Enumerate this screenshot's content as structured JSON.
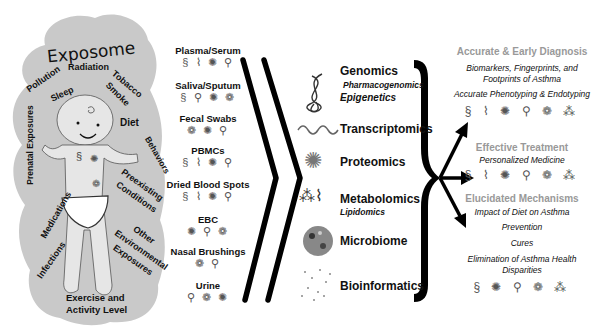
{
  "exposome": {
    "title": "Exposome",
    "factors": [
      "Radiation",
      "Pollution",
      "Sleep",
      "Tobacco",
      "Smoke",
      "Diet",
      "Prenatal Exposures",
      "Behaviors",
      "Preexisting",
      "Conditions",
      "Medications",
      "Other",
      "Environmental",
      "Exposures",
      "Infections",
      "Exercise and",
      "Activity Level"
    ]
  },
  "samples": [
    {
      "label": "Plasma/Serum",
      "icons": "§ ⌇ ✺ ⚲"
    },
    {
      "label": "Saliva/Sputum",
      "icons": "§ ⚲ ✺ ❁"
    },
    {
      "label": "Fecal Swabs",
      "icons": "❁ ✺ ⚲"
    },
    {
      "label": "PBMCs",
      "icons": "§ ⌇ ✺ ⚲"
    },
    {
      "label": "Dried Blood Spots",
      "icons": "§ ⌇ ✺ ⚲"
    },
    {
      "label": "EBC",
      "icons": "✺ ⚲ ❁"
    },
    {
      "label": "Nasal Brushings",
      "icons": "❁ ⚲"
    },
    {
      "label": "Urine",
      "icons": "⚲ ❁ ✺"
    }
  ],
  "omics": [
    {
      "label": "Genomics",
      "subs": [
        "Pharmacogenomics",
        "Epigenetics"
      ],
      "icon": "dna-helix-icon"
    },
    {
      "label": "Transcriptomics",
      "subs": [],
      "icon": "rna-wave-icon"
    },
    {
      "label": "Proteomics",
      "subs": [],
      "icon": "protein-structure-icon"
    },
    {
      "label": "Metabolomics",
      "subs": [
        "Lipidomics"
      ],
      "icon": "molecule-icon"
    },
    {
      "label": "Microbiome",
      "subs": [],
      "icon": "microbe-circle-icon"
    },
    {
      "label": "Bioinformatics",
      "subs": [],
      "icon": "network-dots-icon"
    }
  ],
  "outcomes": {
    "diagnosis": {
      "heading": "Accurate & Early Diagnosis",
      "items": [
        "Biomarkers, Fingerprints, and",
        "Footprints of Asthma",
        "Accurate Phenotyping & Endotyping"
      ],
      "icons": "§ ⌇ ✺ ⚲ ❁ ⁂"
    },
    "treatment": {
      "heading": "Effective Treatment",
      "items": [
        "Personalized Medicine"
      ],
      "icons": "§ ⌇ ✺ ⚲ ❁ ⁂"
    },
    "mechanisms": {
      "heading": "Elucidated Mechanisms",
      "items": [
        "Impact of Diet on Asthma",
        "Prevention",
        "Cures",
        "Elimination of Asthma Health",
        "Disparities"
      ],
      "icons": "§ ✺ ⚲ ❁ ⁂"
    }
  },
  "colors": {
    "cloud": "#c8c8c8",
    "text": "#111111",
    "heading_gray": "#999999",
    "arrows": "#000000"
  }
}
